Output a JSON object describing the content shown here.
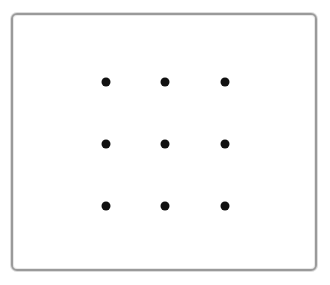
{
  "pattern_lock": {
    "rows": 3,
    "cols": 3,
    "dot_color": "#111111",
    "border_color": "#9a9a9a",
    "dots": [
      {
        "row": 1,
        "col": 1,
        "x": 106,
        "y": 82
      },
      {
        "row": 1,
        "col": 2,
        "x": 165,
        "y": 82
      },
      {
        "row": 1,
        "col": 3,
        "x": 225,
        "y": 82
      },
      {
        "row": 2,
        "col": 1,
        "x": 106,
        "y": 144
      },
      {
        "row": 2,
        "col": 2,
        "x": 165,
        "y": 144
      },
      {
        "row": 2,
        "col": 3,
        "x": 225,
        "y": 144
      },
      {
        "row": 3,
        "col": 1,
        "x": 106,
        "y": 206
      },
      {
        "row": 3,
        "col": 2,
        "x": 165,
        "y": 206
      },
      {
        "row": 3,
        "col": 3,
        "x": 225,
        "y": 206
      }
    ]
  }
}
